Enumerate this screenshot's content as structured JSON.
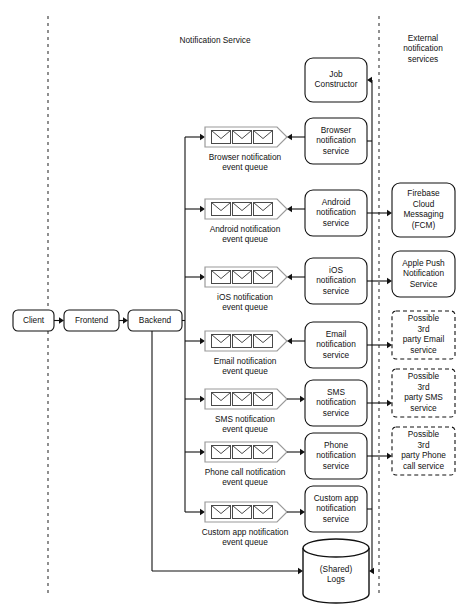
{
  "canvas": {
    "width": 462,
    "height": 608
  },
  "zones": [
    {
      "name": "notification-service",
      "label": "Notification Service",
      "x": 215,
      "y": 41
    },
    {
      "name": "external-services",
      "label": "External\nnotification\nservices",
      "x": 423,
      "y": 49
    }
  ],
  "swimlanes": [
    {
      "name": "client-boundary",
      "x": 48,
      "y1": 16,
      "y2": 594
    },
    {
      "name": "external-boundary",
      "x": 379,
      "y1": 16,
      "y2": 594
    }
  ],
  "client_chain": [
    {
      "name": "client",
      "label": "Client",
      "x": 13,
      "y": 310,
      "w": 41,
      "h": 21
    },
    {
      "name": "frontend",
      "label": "Frontend",
      "x": 64,
      "y": 310,
      "w": 55,
      "h": 21
    },
    {
      "name": "backend",
      "label": "Backend",
      "x": 128,
      "y": 310,
      "w": 54,
      "h": 21
    }
  ],
  "job_constructor": {
    "name": "job-constructor",
    "label": "Job\nConstructor",
    "x": 305,
    "y": 58,
    "w": 62,
    "h": 44
  },
  "rows": [
    {
      "name": "browser",
      "queue_label": "Browser notification\nevent queue",
      "service_label": "Browser\nnotification\nservice",
      "queue_y": 127,
      "service_y": 118,
      "service_h": 46,
      "direction": "service-to-queue",
      "external": null
    },
    {
      "name": "android",
      "queue_label": "Android notification\nevent queue",
      "service_label": "Android\nnotification\nservice",
      "queue_y": 199,
      "service_y": 190,
      "service_h": 46,
      "direction": "service-to-queue",
      "external": "fcm"
    },
    {
      "name": "ios",
      "queue_label": "iOS notification\nevent queue",
      "service_label": "iOS\nnotification\nservice",
      "queue_y": 267,
      "service_y": 258,
      "service_h": 46,
      "direction": "service-to-queue",
      "external": "apns"
    },
    {
      "name": "email",
      "queue_label": "Email notification\nevent queue",
      "service_label": "Email\nnotification\nservice",
      "queue_y": 331,
      "service_y": 322,
      "service_h": 46,
      "direction": "service-to-queue",
      "external": "email3p"
    },
    {
      "name": "sms",
      "queue_label": "SMS notification\nevent queue",
      "service_label": "SMS\nnotification\nservice",
      "queue_y": 389,
      "service_y": 380,
      "service_h": 46,
      "direction": "queue-to-service",
      "external": "sms3p"
    },
    {
      "name": "phone",
      "queue_label": "Phone call notification\nevent queue",
      "service_label": "Phone\nnotification\nservice",
      "queue_y": 442,
      "service_y": 433,
      "service_h": 46,
      "direction": "queue-to-service",
      "external": "phone3p"
    },
    {
      "name": "custom-app",
      "queue_label": "Custom app notification\nevent queue",
      "service_label": "Custom app\nnotification\nservice",
      "queue_y": 502,
      "service_y": 486,
      "service_h": 46,
      "direction": "queue-to-service",
      "external": null
    }
  ],
  "external_services": [
    {
      "name": "fcm",
      "label": "Firebase\nCloud\nMessaging\n(FCM)",
      "x": 392,
      "y": 183,
      "w": 63,
      "h": 54,
      "dashed": false
    },
    {
      "name": "apns",
      "label": "Apple Push\nNotification\nService",
      "x": 392,
      "y": 251,
      "w": 63,
      "h": 46,
      "dashed": false
    },
    {
      "name": "email3p",
      "label": "Possible\n3rd\nparty Email\nservice",
      "x": 392,
      "y": 311,
      "w": 63,
      "h": 48,
      "dashed": true
    },
    {
      "name": "sms3p",
      "label": "Possible\n3rd\nparty SMS\nservice",
      "x": 392,
      "y": 369,
      "w": 63,
      "h": 48,
      "dashed": true
    },
    {
      "name": "phone3p",
      "label": "Possible\n3rd\nparty Phone\ncall service",
      "x": 392,
      "y": 427,
      "w": 63,
      "h": 48,
      "dashed": true
    }
  ],
  "logs": {
    "name": "shared-logs",
    "label": "(Shared)\nLogs",
    "cx": 336,
    "cy": 571,
    "rx": 33,
    "ry": 9,
    "h": 46
  },
  "geometry": {
    "queue_x": 205,
    "queue_w": 72,
    "queue_h": 20,
    "queue_tip": 10,
    "service_x": 305,
    "service_w": 62,
    "backend_bus_x": 185,
    "service_bus_x": 372,
    "logs_bus_x": 152,
    "envelope_count": 3
  },
  "icons": {
    "queue": "envelope-icon",
    "logs": "database-cylinder-icon"
  }
}
